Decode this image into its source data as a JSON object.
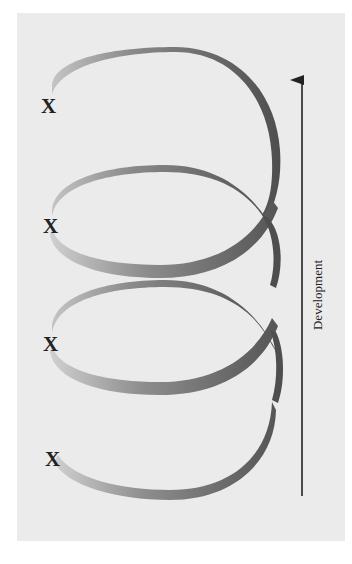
{
  "diagram": {
    "type": "spiral-development",
    "axis_label": "Development",
    "axis_direction": "up",
    "markers": [
      {
        "label": "X",
        "x": 48,
        "y": 107
      },
      {
        "label": "X",
        "x": 50,
        "y": 227
      },
      {
        "label": "X",
        "x": 50,
        "y": 345
      },
      {
        "label": "X",
        "x": 52,
        "y": 460
      }
    ],
    "loops": 4,
    "colors": {
      "background_panel": "#ebebeb",
      "ribbon_dark": "#555555",
      "ribbon_light": "#bdbdbd",
      "arrow": "#222222"
    }
  }
}
